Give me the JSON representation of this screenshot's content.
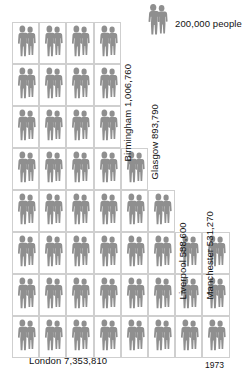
{
  "chart_data": {
    "type": "bar",
    "subtype": "pictogram",
    "title": "",
    "xlabel": "",
    "ylabel": "",
    "year": "1973",
    "unit_value": 200000,
    "unit_label": "200,000 people",
    "categories": [
      "London",
      "Birmingham",
      "Glasgow",
      "Liverpool",
      "Manchester"
    ],
    "values": [
      7353810,
      1006760,
      893790,
      588600,
      531270
    ],
    "value_labels": [
      "7,353,810",
      "1,006,760",
      "893,790",
      "588,600",
      "531,270"
    ],
    "series": [
      {
        "name": "Population 1973",
        "values": [
          7353810,
          1006760,
          893790,
          588600,
          531270
        ]
      }
    ],
    "icon_counts": [
      36,
      5,
      4,
      3,
      3
    ],
    "legend": "200,000 people",
    "grid": false
  },
  "legend": {
    "icon": "people-pair-icon",
    "text": "200,000 people"
  },
  "cities": [
    {
      "key": "london",
      "name": "London",
      "value": "7,353,810",
      "label": "London  7,353,810",
      "icons": 36
    },
    {
      "key": "birmingham",
      "name": "Birmingham",
      "value": "1,006,760",
      "label": "Birmingham 1,006,760",
      "icons": 5
    },
    {
      "key": "glasgow",
      "name": "Glasgow",
      "value": "893,790",
      "label": "Glasgow 893,790",
      "icons": 4
    },
    {
      "key": "liverpool",
      "name": "Liverpool",
      "value": "588,600",
      "label": "Liverpool 588,600",
      "icons": 3
    },
    {
      "key": "manchester",
      "name": "Manchester",
      "value": "531,270",
      "label": "Manchester 531,270",
      "icons": 3
    }
  ],
  "footer": {
    "year": "1973"
  },
  "colors": {
    "figure": "#8f8f8f",
    "cell_border": "#cfcfcf",
    "background": "#ffffff",
    "text": "#111111"
  }
}
